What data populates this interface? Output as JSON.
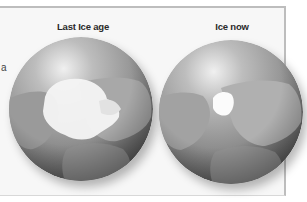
{
  "diagram": {
    "cut_off_text": "a",
    "panels": [
      {
        "label": "Last Ice age",
        "ice_extent": "large"
      },
      {
        "label": "Ice now",
        "ice_extent": "small"
      }
    ],
    "colors": {
      "background": "#f7f7f7",
      "frame": "#bdbdbd",
      "ocean_light": "#c9c9c9",
      "ocean_dark": "#6d6d6d",
      "land": "#a3a3a3",
      "ice": "#ffffff",
      "label_text": "#2a2a2a"
    }
  }
}
